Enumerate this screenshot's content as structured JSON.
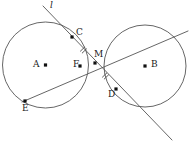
{
  "figure": {
    "width": 189,
    "height": 144,
    "background": "#ffffff",
    "stroke_color": "#555555",
    "point_color": "#111111",
    "label_color": "#1a1a1a"
  },
  "circles": [
    {
      "name": "circle-A",
      "center_label": "A",
      "cx": 45.5,
      "cy": 65,
      "r": 43
    },
    {
      "name": "circle-B",
      "center_label": "B",
      "cx": 145,
      "cy": 66,
      "r": 41
    }
  ],
  "lines": [
    {
      "name": "line-l",
      "label": "l",
      "x1": 43,
      "y1": 6,
      "x2": 172,
      "y2": 140
    },
    {
      "name": "line-ef",
      "label": "",
      "x1": 22,
      "y1": 102,
      "x2": 188,
      "y2": 31
    }
  ],
  "points": [
    {
      "id": "A",
      "label": "A",
      "x": 45.5,
      "y": 65,
      "label_x": 33,
      "label_y": 60,
      "dot": true
    },
    {
      "id": "B",
      "label": "B",
      "x": 145,
      "y": 66,
      "label_x": 151,
      "label_y": 60,
      "dot": true
    },
    {
      "id": "C",
      "label": "C",
      "x": 72,
      "y": 37,
      "label_x": 76,
      "label_y": 28,
      "dot": true
    },
    {
      "id": "M",
      "label": "M",
      "x": 95,
      "y": 63,
      "label_x": 94,
      "label_y": 50,
      "dot": true
    },
    {
      "id": "F",
      "label": "F",
      "x": 80,
      "y": 66,
      "label_x": 73,
      "label_y": 60,
      "dot": true
    },
    {
      "id": "D",
      "label": "D",
      "x": 116,
      "y": 89,
      "label_x": 108,
      "label_y": 90,
      "dot": true
    },
    {
      "id": "E",
      "label": "E",
      "x": 25,
      "y": 101,
      "label_x": 22,
      "label_y": 104,
      "dot": true
    }
  ],
  "tick_marks": [
    {
      "name": "tick-cm",
      "cx": 83.5,
      "cy": 50,
      "angle": 46
    },
    {
      "name": "tick-md",
      "cx": 105.5,
      "cy": 76,
      "angle": 46
    }
  ],
  "line_label": {
    "text": "l",
    "x": 50,
    "y": 1
  }
}
